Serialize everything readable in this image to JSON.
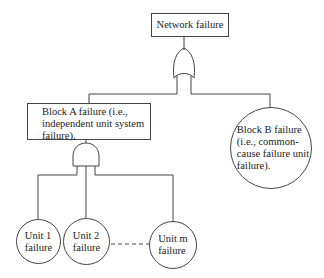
{
  "diagram": {
    "type": "fault-tree",
    "top_event": {
      "label": "Network failure",
      "gate": "OR"
    },
    "block_a": {
      "label": "Block A failure (i.e., independent unit system failure).",
      "lines": [
        "Block A failure (i.e.,",
        "independent unit system",
        "failure)."
      ],
      "gate": "AND"
    },
    "block_b": {
      "label": "Block B failure (i.e., common-cause failure unit failure).",
      "lines": [
        "Block B failure",
        "(i.e., common-",
        "cause failure unit",
        "failure)."
      ]
    },
    "units": [
      {
        "lines": [
          "Unit 1",
          "failure"
        ]
      },
      {
        "lines": [
          "Unit 2",
          "failure"
        ]
      },
      {
        "lines": [
          "Unit m",
          "failure"
        ]
      }
    ],
    "colors": {
      "line": "#444444",
      "background": "#ffffff",
      "text": "#222222"
    }
  }
}
